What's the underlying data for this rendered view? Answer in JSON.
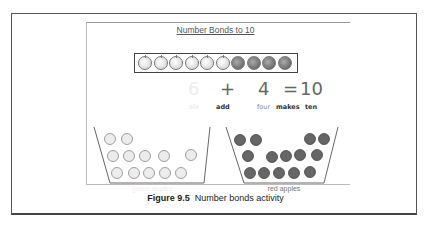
{
  "figure": {
    "title": "Number Bonds to 10",
    "ten_frame": {
      "green": 6,
      "red": 4
    },
    "equation": {
      "a": "6",
      "op": "+",
      "b": "4",
      "eq": "=",
      "result": "10"
    },
    "words": {
      "a": "six",
      "op": "add",
      "b": "four",
      "eq": "makes",
      "result": "ten"
    },
    "baskets": [
      {
        "label": "green apples",
        "count": 12
      },
      {
        "label": "red apples",
        "count": 14
      }
    ],
    "caption": {
      "number": "Figure 9.5",
      "text": "Number bonds activity"
    }
  }
}
